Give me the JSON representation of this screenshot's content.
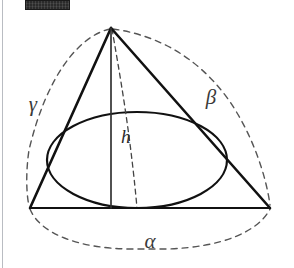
{
  "figure": {
    "background_color": "#ffffff",
    "stroke_color": "#1a1a1a",
    "dash_color": "#555555",
    "border_rule_color": "#b9bcc2",
    "redaction_bar": {
      "name": "redacted-watermark-bar",
      "color": "#2b2b2b",
      "x": 25,
      "y": 0,
      "width": 45,
      "height": 10
    },
    "labels": {
      "alpha": "α",
      "beta": "β",
      "gamma": "γ",
      "height": "h"
    },
    "label_positions": {
      "alpha": {
        "x": 150,
        "y": 248
      },
      "beta": {
        "x": 211,
        "y": 104
      },
      "gamma": {
        "x": 33,
        "y": 111
      },
      "height": {
        "x": 121,
        "y": 143
      }
    },
    "geometry": {
      "apex": {
        "x": 111,
        "y": 28
      },
      "base_left": {
        "x": 30,
        "y": 208
      },
      "base_right": {
        "x": 270,
        "y": 208
      },
      "ellipse": {
        "cx": 137,
        "cy": 160,
        "rx": 90,
        "ry": 48
      },
      "height_line": {
        "x1": 111,
        "y1": 28,
        "x2": 111,
        "y2": 208
      }
    },
    "elements": [
      {
        "name": "triangle-outline",
        "kind": "solid",
        "description": "cone cross-section triangle"
      },
      {
        "name": "base-line",
        "kind": "solid",
        "description": "horizontal base of triangle"
      },
      {
        "name": "height-line-h",
        "kind": "solid",
        "description": "vertical altitude from apex to base"
      },
      {
        "name": "inscribed-ellipse",
        "kind": "solid",
        "description": "ellipse inscribed touching the two slant sides and base"
      },
      {
        "name": "hidden-slant-dashed",
        "kind": "dashed",
        "description": "hidden edge from apex to ellipse base point"
      },
      {
        "name": "arc-alpha",
        "kind": "dashed",
        "description": "bottom dashed arc spanning base vertices"
      },
      {
        "name": "arc-beta",
        "kind": "dashed",
        "description": "right dashed arc from apex to bottom-right vertex"
      },
      {
        "name": "arc-gamma",
        "kind": "dashed",
        "description": "left dashed arc from apex to bottom-left vertex"
      }
    ]
  }
}
